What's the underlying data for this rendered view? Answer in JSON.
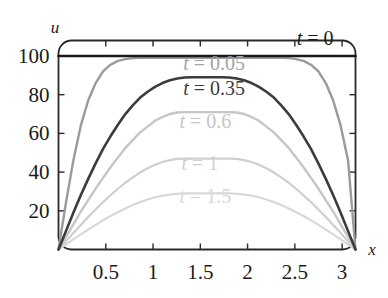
{
  "chart_data": {
    "type": "line",
    "title": "",
    "xlabel": "x",
    "ylabel": "u",
    "xlim": [
      0,
      3.14159
    ],
    "ylim": [
      0,
      108
    ],
    "grid": false,
    "legend_position": "inline-annotations",
    "xticks": [
      0.5,
      1,
      1.5,
      2,
      2.5,
      3
    ],
    "xtick_labels": [
      "0.5",
      "1",
      "1.5",
      "2",
      "2.5",
      "3"
    ],
    "yticks": [
      20,
      40,
      60,
      80,
      100
    ],
    "ytick_labels": [
      "20",
      "40",
      "60",
      "80",
      "100"
    ],
    "x": [
      0,
      0.0785,
      0.1571,
      0.2356,
      0.3142,
      0.3927,
      0.4712,
      0.5498,
      0.6283,
      0.7069,
      0.7854,
      0.8639,
      0.9425,
      1.021,
      1.0996,
      1.1781,
      1.2566,
      1.3352,
      1.4137,
      1.4923,
      1.5708,
      1.6493,
      1.7279,
      1.8064,
      1.885,
      1.9635,
      2.042,
      2.1206,
      2.1991,
      2.2777,
      2.3562,
      2.4348,
      2.5133,
      2.5918,
      2.6704,
      2.7489,
      2.8274,
      2.906,
      2.9845,
      3.0631,
      3.1416
    ],
    "series": [
      {
        "name": "t = 0",
        "label": "t = 0",
        "t": 0,
        "color": "#1a1a1a",
        "width": 2.6,
        "peak": 100,
        "label_x": 2.52,
        "label_y": 105.5,
        "values": [
          100,
          100,
          100,
          100,
          100,
          100,
          100,
          100,
          100,
          100,
          100,
          100,
          100,
          100,
          100,
          100,
          100,
          100,
          100,
          100,
          100,
          100,
          100,
          100,
          100,
          100,
          100,
          100,
          100,
          100,
          100,
          100,
          100,
          100,
          100,
          100,
          100,
          100,
          100,
          100,
          100
        ]
      },
      {
        "name": "t = 0.05",
        "label": "t = 0.05",
        "t": 0.05,
        "color": "#9a9a9a",
        "width": 2.4,
        "peak": 99,
        "label_x": 1.32,
        "label_y": 93,
        "values": [
          0,
          24,
          46,
          64,
          77,
          86,
          92,
          95.5,
          97.5,
          98.4,
          98.9,
          99,
          99.1,
          99.1,
          99.1,
          99.1,
          99.1,
          99.1,
          99.1,
          99.1,
          99.1,
          99.1,
          99.1,
          99.1,
          99.1,
          99.1,
          99.1,
          99.1,
          99.1,
          99.1,
          99,
          98.9,
          98.4,
          97.5,
          95.5,
          92,
          86,
          77,
          64,
          46,
          0
        ]
      },
      {
        "name": "t = 0.35",
        "label": "t = 0.35",
        "t": 0.35,
        "color": "#3c3c3c",
        "width": 2.6,
        "peak": 89,
        "label_x": 1.32,
        "label_y": 80,
        "values": [
          0,
          9.5,
          19,
          28,
          36.5,
          44.5,
          52,
          58.5,
          64.5,
          70,
          74.5,
          78.5,
          81.5,
          84,
          86,
          87.5,
          88.4,
          88.9,
          89,
          89,
          89,
          89,
          89,
          88.9,
          88.4,
          87.5,
          86,
          84,
          81.5,
          78.5,
          74.5,
          70,
          64.5,
          58.5,
          52,
          44.5,
          36.5,
          28,
          19,
          9.5,
          0
        ]
      },
      {
        "name": "t = 0.6",
        "label": "t = 0.6",
        "t": 0.6,
        "color": "#c6c6c6",
        "width": 2.4,
        "peak": 71,
        "label_x": 1.28,
        "label_y": 63,
        "values": [
          0,
          6.5,
          13,
          19.5,
          25.5,
          31.5,
          37,
          42.5,
          47.5,
          52.5,
          56.5,
          60.5,
          63.5,
          66.5,
          68.5,
          70,
          70.8,
          71,
          71,
          71,
          71,
          71,
          71,
          71,
          70.8,
          70,
          68.5,
          66.5,
          63.5,
          60.5,
          56.5,
          52.5,
          47.5,
          42.5,
          37,
          31.5,
          25.5,
          19.5,
          13,
          6.5,
          0
        ]
      },
      {
        "name": "t = 1",
        "label": "t = 1",
        "t": 1,
        "color": "#cfcfcf",
        "width": 2.2,
        "peak": 47,
        "label_x": 1.3,
        "label_y": 41,
        "values": [
          0,
          4.2,
          8.5,
          12.7,
          16.8,
          20.7,
          24.5,
          28,
          31.4,
          34.5,
          37.3,
          39.8,
          42,
          43.8,
          45.2,
          46.2,
          46.8,
          47,
          47,
          47,
          47,
          47,
          47,
          47,
          46.8,
          46.2,
          45.2,
          43.8,
          42,
          39.8,
          37.3,
          34.5,
          31.4,
          28,
          24.5,
          20.7,
          16.8,
          12.7,
          8.5,
          4.2,
          0
        ]
      },
      {
        "name": "t = 1.5",
        "label": "t = 1.5",
        "t": 1.5,
        "color": "#d8d8d8",
        "width": 2.2,
        "peak": 29,
        "label_x": 1.28,
        "label_y": 24,
        "values": [
          0,
          2.6,
          5.2,
          7.8,
          10.3,
          12.7,
          15.1,
          17.3,
          19.3,
          21.2,
          23,
          24.5,
          25.8,
          27,
          27.8,
          28.4,
          28.8,
          29,
          29,
          29,
          29,
          29,
          29,
          29,
          28.8,
          28.4,
          27.8,
          27,
          25.8,
          24.5,
          23,
          21.2,
          19.3,
          17.3,
          15.1,
          12.7,
          10.3,
          7.8,
          5.2,
          2.6,
          0
        ]
      }
    ]
  },
  "frame": {
    "color": "#2a2a2a"
  }
}
